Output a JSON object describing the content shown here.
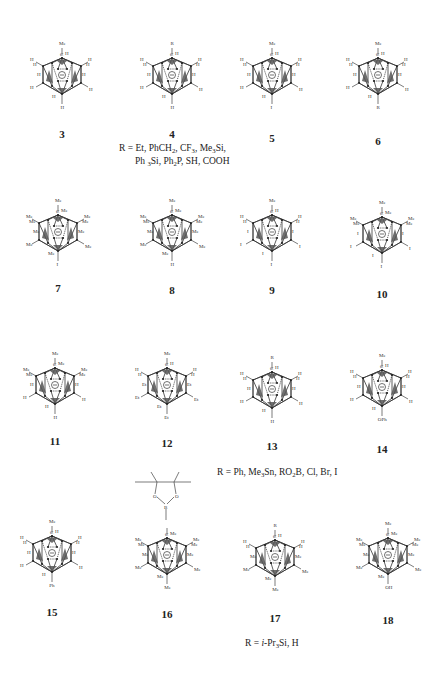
{
  "figure": {
    "cage_charge_symbol": "⊖",
    "compounds": [
      {
        "id": "3",
        "cx": 62,
        "cy": 75,
        "top": "Me",
        "c_sub": "H",
        "ul": "H",
        "ul2": "H",
        "ur": "H",
        "ur2": "H",
        "ml": "H",
        "mr": "H",
        "ll": "H",
        "lr": "H",
        "bl": "H",
        "bottom": "H",
        "num_y": 128
      },
      {
        "id": "4",
        "cx": 172,
        "cy": 75,
        "top": "R",
        "c_sub": "H",
        "ul": "H",
        "ul2": "H",
        "ur": "H",
        "ur2": "H",
        "ml": "H",
        "mr": "H",
        "ll": "H",
        "lr": "H",
        "bl": "H",
        "bottom": "H",
        "num_y": 128
      },
      {
        "id": "5",
        "cx": 272,
        "cy": 75,
        "top": "Me",
        "c_sub": "H",
        "ul": "H",
        "ul2": "H",
        "ur": "H",
        "ur2": "H",
        "ml": "H",
        "mr": "H",
        "ll": "H",
        "lr": "H",
        "bl": "H",
        "bottom": "I",
        "num_y": 132
      },
      {
        "id": "6",
        "cx": 378,
        "cy": 75,
        "top": "Me",
        "c_sub": "H",
        "ul": "H",
        "ul2": "H",
        "ur": "H",
        "ur2": "H",
        "ml": "H",
        "mr": "H",
        "ll": "H",
        "lr": "H",
        "bl": "H",
        "bottom": "R",
        "num_y": 135
      },
      {
        "id": "7",
        "cx": 58,
        "cy": 232,
        "top": "Me",
        "c_sub": "Me",
        "ul": "Me",
        "ul2": "Me",
        "ur": "Me",
        "ur2": "Me",
        "ml": "Me",
        "mr": "Me",
        "ll": "Me",
        "lr": "Me",
        "bl": "Me",
        "bottom": "I",
        "num_y": 282
      },
      {
        "id": "8",
        "cx": 172,
        "cy": 232,
        "top": "Me",
        "c_sub": "Me",
        "ul": "Me",
        "ul2": "Me",
        "ur": "Me",
        "ur2": "Me",
        "ml": "Me",
        "mr": "Me",
        "ll": "Me",
        "lr": "Me",
        "bl": "Me",
        "bottom": "H",
        "num_y": 284
      },
      {
        "id": "9",
        "cx": 272,
        "cy": 232,
        "top": "Me",
        "c_sub": "H",
        "ul": "H",
        "ul2": "H",
        "ur": "H",
        "ur2": "H",
        "ml": "I",
        "mr": "I",
        "ll": "I",
        "lr": "I",
        "bl": "I",
        "bottom": "I",
        "num_y": 284
      },
      {
        "id": "10",
        "cx": 382,
        "cy": 234,
        "top": "Me",
        "c_sub": "Me",
        "ul": "Me",
        "ul2": "Me",
        "ur": "Me",
        "ur2": "Me",
        "ml": "I",
        "mr": "I",
        "ll": "I",
        "lr": "I",
        "bl": "I",
        "bottom": "I",
        "num_y": 288
      },
      {
        "id": "11",
        "cx": 55,
        "cy": 385,
        "top": "Me",
        "c_sub": "Me",
        "ul": "Me",
        "ul2": "Me",
        "ur": "Me",
        "ur2": "Me",
        "ml": "H",
        "mr": "H",
        "ll": "H",
        "lr": "H",
        "bl": "H",
        "bottom": "H",
        "num_y": 435
      },
      {
        "id": "12",
        "cx": 167,
        "cy": 385,
        "top": "Me",
        "c_sub": "H",
        "ul": "H",
        "ul2": "H",
        "ur": "H",
        "ur2": "H",
        "ml": "Et",
        "mr": "Et",
        "ll": "Et",
        "lr": "Et",
        "bl": "Et",
        "bottom": "Et",
        "num_y": 437
      },
      {
        "id": "13",
        "cx": 272,
        "cy": 389,
        "top": "R",
        "c_sub": "H",
        "ul": "H",
        "ul2": "H",
        "ur": "H",
        "ur2": "H",
        "ml": "H",
        "mr": "H",
        "ll": "H",
        "lr": "H",
        "bl": "H",
        "bottom": "H",
        "num_y": 440
      },
      {
        "id": "14",
        "cx": 382,
        "cy": 387,
        "top": "Me",
        "c_sub": "H",
        "ul": "H",
        "ul2": "H",
        "ur": "H",
        "ur2": "H",
        "ml": "H",
        "mr": "H",
        "ll": "H",
        "lr": "H",
        "bl": "H",
        "bottom": "OPh",
        "num_y": 443
      },
      {
        "id": "15",
        "cx": 52,
        "cy": 553,
        "top": "Me",
        "c_sub": "H",
        "ul": "H",
        "ul2": "H",
        "ur": "H",
        "ur2": "H",
        "ml": "H",
        "mr": "H",
        "ll": "H",
        "lr": "H",
        "bl": "H",
        "bottom": "Ph",
        "num_y": 606
      },
      {
        "id": "16",
        "cx": 167,
        "cy": 555,
        "top": "B(pin)",
        "c_sub": "Me",
        "ul": "Me",
        "ul2": "Me",
        "ur": "Me",
        "ur2": "Me",
        "ml": "Me",
        "mr": "Me",
        "ll": "Me",
        "lr": "Me",
        "bl": "Me",
        "bottom": "Me",
        "num_y": 608
      },
      {
        "id": "17",
        "cx": 275,
        "cy": 557,
        "top": "R",
        "c_sub": "H",
        "ul": "H",
        "ul2": "H",
        "ur": "H",
        "ur2": "H",
        "ml": "Me",
        "mr": "Me",
        "ll": "Me",
        "lr": "Me",
        "bl": "Me",
        "bottom": "Me",
        "num_y": 612
      },
      {
        "id": "18",
        "cx": 388,
        "cy": 555,
        "top": "Me",
        "c_sub": "Me",
        "ul": "Me",
        "ul2": "Me",
        "ur": "Me",
        "ur2": "Me",
        "ml": "Me",
        "mr": "Me",
        "ll": "Me",
        "lr": "Me",
        "bl": "Me",
        "bottom": "OH",
        "num_y": 614
      }
    ],
    "r_notes": {
      "note_4_line1": "R = Et, PhCH₂, CF₃, Me₃Si,",
      "note_4_line2": "Ph ₃Si, Ph₂P, SH, COOH",
      "note_13": "R = Ph, Me₃Sn, RO₂B, Cl, Br, I",
      "note_17": "R = i-Pr₃Si, H"
    },
    "pinacol_labels": {
      "o1": "O",
      "o2": "O",
      "b": "B"
    }
  }
}
